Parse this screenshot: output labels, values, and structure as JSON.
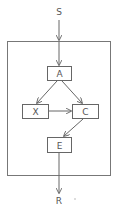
{
  "diagram": {
    "stroke_color": "#666666",
    "text_color": "#555555",
    "background": "#ffffff",
    "entry_label": "S",
    "exit_label": "R",
    "container": {
      "x": 7,
      "y": 41,
      "w": 103,
      "h": 134
    },
    "nodes": [
      {
        "id": "A",
        "label": "A",
        "x": 47,
        "y": 66,
        "w": 24,
        "h": 14
      },
      {
        "id": "X",
        "label": "X",
        "x": 22,
        "y": 104,
        "w": 26,
        "h": 14
      },
      {
        "id": "C",
        "label": "C",
        "x": 72,
        "y": 104,
        "w": 26,
        "h": 14
      },
      {
        "id": "E",
        "label": "E",
        "x": 47,
        "y": 137,
        "w": 24,
        "h": 15
      }
    ],
    "edges": [
      {
        "from": "S",
        "to": "container"
      },
      {
        "from": "container",
        "to": "A"
      },
      {
        "from": "A",
        "to": "X"
      },
      {
        "from": "A",
        "to": "C"
      },
      {
        "from": "X",
        "to": "C"
      },
      {
        "from": "C",
        "to": "E"
      },
      {
        "from": "E",
        "to": "R"
      }
    ]
  }
}
